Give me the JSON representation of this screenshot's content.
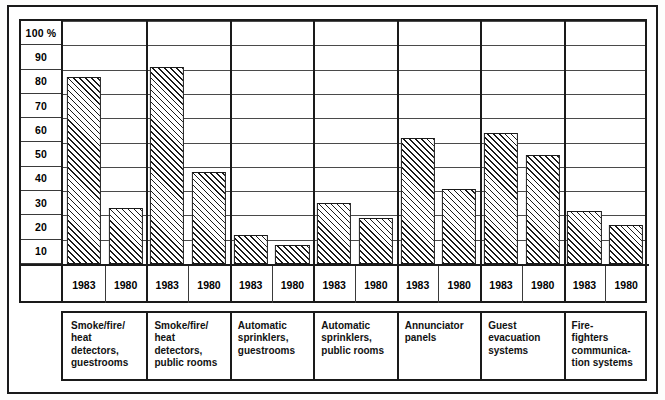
{
  "chart_data": {
    "type": "bar",
    "title": "",
    "subtitle": "",
    "xlabel": "",
    "ylabel": "",
    "ylim": [
      0,
      100
    ],
    "y_unit": "%",
    "grid": true,
    "legend_position": "none",
    "y_ticks": [
      "100 %",
      "90",
      "80",
      "70",
      "60",
      "50",
      "40",
      "30",
      "20",
      "10"
    ],
    "y_tick_values": [
      100,
      90,
      80,
      70,
      60,
      50,
      40,
      30,
      20,
      10
    ],
    "categories": [
      "Smoke/fire/\nheat\ndetectors,\nguestrooms",
      "Smoke/fire/\nheat\ndetectors,\npublic rooms",
      "Automatic\nsprinklers,\nguestrooms",
      "Automatic\nsprinklers,\npublic rooms",
      "Annunciator\npanels",
      "Guest\nevacuation\nsystems",
      "Fire-\nfighters\ncommunica-\ntion systems"
    ],
    "series": [
      {
        "name": "1983",
        "values": [
          77,
          81,
          12,
          25,
          52,
          54,
          22
        ]
      },
      {
        "name": "1980",
        "values": [
          23,
          38,
          8,
          19,
          31,
          45,
          16
        ]
      }
    ],
    "group_labels": [
      [
        "1983",
        "1980"
      ],
      [
        "1983",
        "1980"
      ],
      [
        "1983",
        "1980"
      ],
      [
        "1983",
        "1980"
      ],
      [
        "1983",
        "1980"
      ],
      [
        "1983",
        "1980"
      ],
      [
        "1983",
        "1980"
      ]
    ],
    "bar_fill": "diagonal-hatch",
    "colors": {
      "bar_outline": "#1a1a1a",
      "hatch": "#1a1a1a",
      "grid": "#4a4a4a",
      "frame": "#1a1a1a",
      "background": "#ffffff"
    }
  }
}
